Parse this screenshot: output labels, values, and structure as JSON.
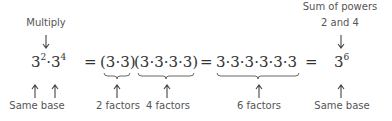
{
  "annotations": {
    "multiply": "Multiply",
    "sum_of_powers_line1": "Sum of powers",
    "sum_of_powers_line2": "2 and 4",
    "same_base_left": "Same base",
    "two_factors": "2 factors",
    "four_factors": "4 factors",
    "six_factors": "6 factors",
    "same_base_right": "Same base"
  },
  "expression": {
    "lhs_base1": "3",
    "lhs_exp1": "2",
    "dot": "·",
    "lhs_base2": "3",
    "lhs_exp2": "4",
    "eq1": "=",
    "group1": "(3·3)",
    "group2": "(3·3·3·3)",
    "eq2": "=",
    "expanded": "3·3·3·3·3·3",
    "eq3": "=",
    "result_base": "3",
    "result_exp": "6"
  }
}
